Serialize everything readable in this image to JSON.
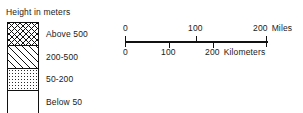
{
  "legend": {
    "title": "Height in meters",
    "classes": [
      {
        "label": "Above 500",
        "pattern": "crosshatch",
        "range_min": 500,
        "range_max": null
      },
      {
        "label": "200-500",
        "pattern": "diagonal",
        "range_min": 200,
        "range_max": 500
      },
      {
        "label": "50-200",
        "pattern": "dots-dense",
        "range_min": 50,
        "range_max": 200
      },
      {
        "label": "Below 50",
        "pattern": "dots-sparse",
        "range_min": null,
        "range_max": 50
      }
    ]
  },
  "scalebar": {
    "miles": {
      "unit": "Miles",
      "ticks": [
        "0",
        "100",
        "200"
      ],
      "max": 200
    },
    "kilometers": {
      "unit": "Kilometers",
      "ticks": [
        "0",
        "100",
        "200"
      ],
      "max": 200
    }
  },
  "colors": {
    "ink": "#111111",
    "background": "#ffffff"
  }
}
